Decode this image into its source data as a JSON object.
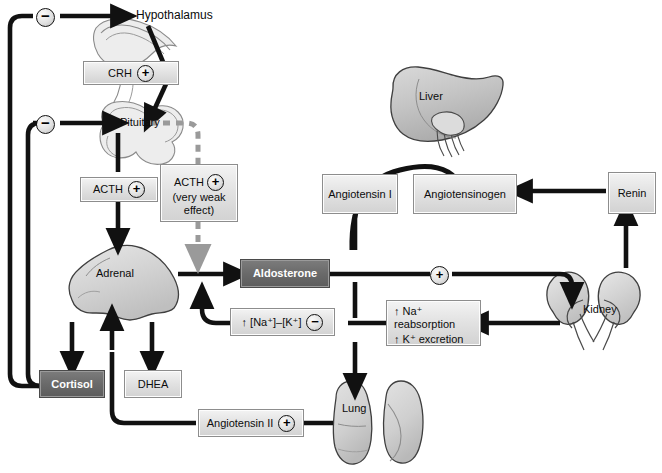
{
  "diagram": {
    "colors": {
      "dark_box_fill": "#6a6a6a",
      "dark_box_text": "#ffffff",
      "light_box_fill": "#e3e3e3",
      "light_box_text": "#0d0d0d",
      "wire": "#111111",
      "weak_wire": "#9a9a9a",
      "organ_fill": "#c9c9c9",
      "organ_stroke": "#3b3b3b"
    }
  },
  "organs": {
    "hypothalamus": "Hypothalamus",
    "pituitary": "Pituitary",
    "adrenal": "Adrenal",
    "liver": "Liver",
    "kidney": "Kidney",
    "lung": "Lung"
  },
  "boxes": {
    "crh": {
      "label": "CRH",
      "sign": "+"
    },
    "acth": {
      "label": "ACTH",
      "sign": "+"
    },
    "acth_weak": {
      "label": "ACTH",
      "sign": "+",
      "sub": "(very weak effect)",
      "sub_line1": "(very weak",
      "sub_line2": "effect)"
    },
    "cortisol": {
      "label": "Cortisol"
    },
    "dhea": {
      "label": "DHEA"
    },
    "aldosterone": {
      "label": "Aldosterone"
    },
    "angiotensin_i": {
      "label": "Angiotensin I"
    },
    "angiotensinogen": {
      "label": "Angiotensinogen"
    },
    "renin": {
      "label": "Renin"
    },
    "angiotensin_ii": {
      "label": "Angiotensin II",
      "sign": "+"
    },
    "na_k_ratio": {
      "label": "↑ [Na⁺]–[K⁺]",
      "sign": "−"
    },
    "na_k_transport": {
      "line1": "↑ Na⁺ reabsorption",
      "line2": "↑ K⁺ excretion"
    }
  },
  "signs": {
    "feedback_hypothalamus": "−",
    "feedback_pituitary": "−",
    "aldosterone_kidney": "+"
  }
}
